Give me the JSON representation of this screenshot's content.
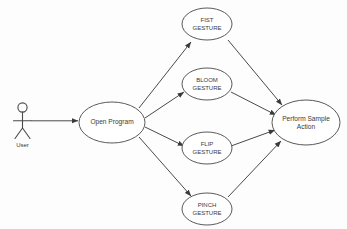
{
  "diagram": {
    "type": "uml-use-case-diagram",
    "background_color": "#fdfdfd",
    "line_color": "#4a4a4a",
    "node_stroke_color": "#5a5a5a",
    "node_fill_color": "#ffffff",
    "text_color": "#3a3a3a",
    "actor": {
      "name": "User",
      "label": "User"
    },
    "use_cases": [
      {
        "id": "open-program",
        "label": "Open Program",
        "line1": "Open Program",
        "line2": ""
      },
      {
        "id": "fist-gesture",
        "label": "FIST GESTURE",
        "line1": "FIST",
        "line2": "GESTURE"
      },
      {
        "id": "bloom-gesture",
        "label": "BLOOM GESTURE",
        "line1": "BLOOM",
        "line2": "GESTURE"
      },
      {
        "id": "flip-gesture",
        "label": "FLIP GESTURE",
        "line1": "FLIP",
        "line2": "GESTURE"
      },
      {
        "id": "pinch-gesture",
        "label": "PINCH GESTURE",
        "line1": "PINCH",
        "line2": "GESTURE"
      },
      {
        "id": "perform-sample-action",
        "label": "Perform Sample Action",
        "line1": "Perform Sample",
        "line2": "Action"
      }
    ],
    "associations": [
      {
        "from": "User",
        "to": "Open Program",
        "arrow": true
      },
      {
        "from": "Open Program",
        "to": "FIST GESTURE",
        "arrow": true
      },
      {
        "from": "Open Program",
        "to": "BLOOM GESTURE",
        "arrow": true
      },
      {
        "from": "Open Program",
        "to": "FLIP GESTURE",
        "arrow": true
      },
      {
        "from": "Open Program",
        "to": "PINCH GESTURE",
        "arrow": true
      },
      {
        "from": "FIST GESTURE",
        "to": "Perform Sample Action",
        "arrow": true
      },
      {
        "from": "BLOOM GESTURE",
        "to": "Perform Sample Action",
        "arrow": true
      },
      {
        "from": "FLIP GESTURE",
        "to": "Perform Sample Action",
        "arrow": true
      },
      {
        "from": "PINCH GESTURE",
        "to": "Perform Sample Action",
        "arrow": true
      }
    ]
  }
}
